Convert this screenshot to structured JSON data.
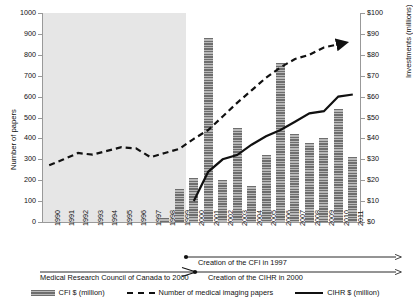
{
  "chart_data": {
    "type": "bar",
    "title": "",
    "xlabel": "",
    "ylabel": "Number of papers",
    "y2label": "Investments (millions)",
    "ylim": [
      0,
      1000
    ],
    "y2lim": [
      0,
      100
    ],
    "grid": false,
    "legend_position": "bottom",
    "categories": [
      "1990",
      "1991",
      "1992",
      "1993",
      "1994",
      "1995",
      "1996",
      "1997",
      "1998",
      "1999",
      "2000",
      "2001",
      "2002",
      "2003",
      "2004",
      "2005",
      "2006",
      "2007",
      "2008",
      "2009",
      "2010",
      "2011"
    ],
    "y_ticks": [
      "0",
      "100",
      "200",
      "300",
      "400",
      "500",
      "600",
      "700",
      "800",
      "900",
      "1000"
    ],
    "y2_ticks": [
      "$0",
      "$10",
      "$20",
      "$30",
      "$40",
      "$50",
      "$60",
      "$70",
      "$80",
      "$90",
      "$100"
    ],
    "shaded_region": {
      "from": "1990",
      "to": "1999",
      "color": "#e6e6e6"
    },
    "series": [
      {
        "name": "CFI $ (million)",
        "type": "bar",
        "axis": "right",
        "unit": "million",
        "values": [
          null,
          null,
          null,
          null,
          null,
          null,
          null,
          null,
          2,
          16,
          21,
          88,
          20,
          45,
          17,
          32,
          76,
          42,
          38,
          40,
          54,
          31
        ]
      },
      {
        "name": "Number of medical imaging papers",
        "type": "line",
        "style": "dashed",
        "axis": "left",
        "values": [
          272,
          300,
          330,
          322,
          340,
          358,
          352,
          310,
          330,
          350,
          398,
          440,
          505,
          570,
          630,
          690,
          740,
          780,
          800,
          835,
          850,
          null
        ]
      },
      {
        "name": "CIHR $ (million)",
        "type": "line",
        "style": "solid",
        "axis": "right",
        "unit": "million",
        "values": [
          null,
          null,
          null,
          null,
          null,
          null,
          null,
          null,
          null,
          null,
          10,
          24,
          30,
          32,
          37,
          41,
          44,
          48,
          52,
          53,
          60,
          61
        ]
      }
    ],
    "annotations": [
      {
        "text": "Medical Research Council of Canada to 2000",
        "kind": "timeline-label"
      },
      {
        "text": "Creation of the CFI in 1997",
        "kind": "timeline-label"
      },
      {
        "text": "Creation of the CIHR in 2000",
        "kind": "timeline-label"
      }
    ]
  },
  "legend": {
    "items": [
      {
        "label": "CFI $ (million)",
        "marker": "bar-swatch"
      },
      {
        "label": "Number of medical imaging papers",
        "marker": "dashed-line-swatch"
      },
      {
        "label": "CIHR $ (million)",
        "marker": "solid-line-swatch"
      }
    ]
  },
  "colors": {
    "bar_dark": "#6e6e6e",
    "bar_light": "#b8b8b8",
    "line": "#111111",
    "shade": "#e6e6e6",
    "axis": "#999999"
  }
}
